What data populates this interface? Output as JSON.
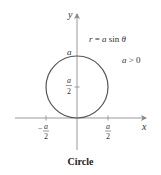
{
  "figure": {
    "caption": "Circle",
    "equation": {
      "lhs": "r",
      "eq": " = ",
      "rhs_a": "a",
      "rhs_fn": " sin ",
      "rhs_theta": "θ"
    },
    "condition": {
      "a": "a",
      "op": " > ",
      "zero": "0"
    },
    "axes": {
      "x_label": "x",
      "y_label": "y"
    },
    "ticks": {
      "y_top": "a",
      "y_mid_num": "a",
      "y_mid_den": "2",
      "x_neg_sign": "−",
      "x_neg_num": "a",
      "x_neg_den": "2",
      "x_pos_num": "a",
      "x_pos_den": "2"
    },
    "colors": {
      "curve": "#555555",
      "axes": "#888888",
      "text": "#333333"
    }
  }
}
